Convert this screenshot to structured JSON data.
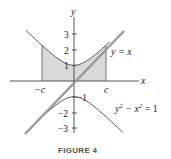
{
  "figure": {
    "caption": "FIGURE 4",
    "axes": {
      "x_label": "x",
      "y_label": "y",
      "y_ticks": [
        {
          "value": 3,
          "label": "3"
        },
        {
          "value": 2,
          "label": "2"
        },
        {
          "value": 1,
          "label": "1"
        },
        {
          "value": -1,
          "label": "−1"
        },
        {
          "value": -2,
          "label": "−2"
        },
        {
          "value": -3,
          "label": "−3"
        }
      ],
      "x_marks": [
        {
          "value": "-c",
          "label": "−c"
        },
        {
          "value": "c",
          "label": "c"
        }
      ]
    },
    "curves": {
      "line_label": "y = x",
      "hyperbola_label_base": "y",
      "hyperbola_label_exp1": "2",
      "hyperbola_label_mid": " − x",
      "hyperbola_label_exp2": "2",
      "hyperbola_label_tail": " = 1"
    },
    "shaded_region": {
      "description": "region under upper branch of y^2 - x^2 = 1, above x-axis, from -c to c",
      "color": "#d9d9d9"
    },
    "colors": {
      "curve": "#555555",
      "axis": "#444444",
      "shade": "#d9d9d9"
    }
  }
}
